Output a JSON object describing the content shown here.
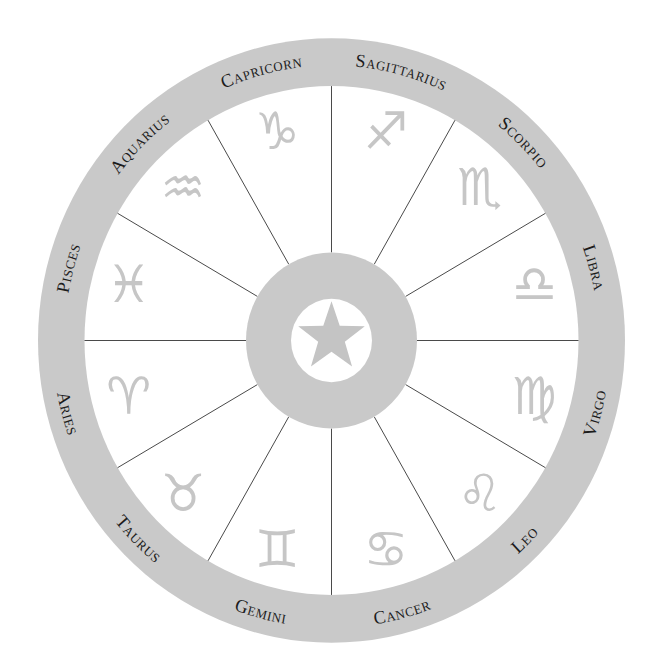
{
  "colors": {
    "ring": "#c9c9c9",
    "glyph": "#c6c6c6",
    "label": "#1c1c1c",
    "spoke": "#4a4a4a",
    "background": "#ffffff"
  },
  "geometry": {
    "center": [
      331.5,
      340.5
    ],
    "vertical_scale": 1.03,
    "outer_radius": 293.5,
    "inner_radius": 247,
    "hub_radius": 85.5,
    "hub_inner_radius": 40.5,
    "star_radius": 35,
    "glyph_radius": 210,
    "label_radius_upper": 267,
    "label_radius_lower": 279,
    "spoke_angles": [
      0,
      30,
      60,
      90,
      120,
      150,
      180,
      210,
      240,
      270,
      300,
      330
    ]
  },
  "center_icon": "star-icon",
  "signs": [
    {
      "name": "Capricorn",
      "glyph": "♑︎",
      "icon": "capricorn-icon",
      "angle": 105
    },
    {
      "name": "Sagittarius",
      "glyph": "♐︎",
      "icon": "sagittarius-icon",
      "angle": 75
    },
    {
      "name": "Scorpio",
      "glyph": "♏︎",
      "icon": "scorpio-icon",
      "angle": 45
    },
    {
      "name": "Libra",
      "glyph": "♎︎",
      "icon": "libra-icon",
      "angle": 15
    },
    {
      "name": "Virgo",
      "glyph": "♍︎",
      "icon": "virgo-icon",
      "angle": -15
    },
    {
      "name": "Leo",
      "glyph": "♌︎",
      "icon": "leo-icon",
      "angle": -45
    },
    {
      "name": "Cancer",
      "glyph": "♋︎",
      "icon": "cancer-icon",
      "angle": -75
    },
    {
      "name": "Gemini",
      "glyph": "♊︎",
      "icon": "gemini-icon",
      "angle": -105
    },
    {
      "name": "Taurus",
      "glyph": "♉︎",
      "icon": "taurus-icon",
      "angle": -135
    },
    {
      "name": "Aries",
      "glyph": "♈︎",
      "icon": "aries-icon",
      "angle": -165
    },
    {
      "name": "Pisces",
      "glyph": "♓︎",
      "icon": "pisces-icon",
      "angle": 165
    },
    {
      "name": "Aquarius",
      "glyph": "♒︎",
      "icon": "aquarius-icon",
      "angle": 135
    }
  ]
}
